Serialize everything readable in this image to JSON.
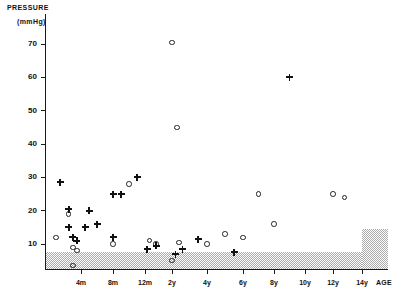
{
  "chart_data": {
    "type": "scatter",
    "title": "PRESSURE",
    "subtitle": "(mmHg)",
    "ylabel": "PRESSURE (mmHg)",
    "xlabel": "AGE",
    "ylim": [
      0,
      75
    ],
    "yticks": [
      10,
      20,
      30,
      40,
      50,
      60,
      70
    ],
    "ytick_labels": [
      "10",
      "20",
      "30",
      "40",
      "50",
      "60",
      "70"
    ],
    "xtick_labels": [
      "4m",
      "8m",
      "12m",
      "2y",
      "4y",
      "6y",
      "8y",
      "10y",
      "12y",
      "14y"
    ],
    "grid": false,
    "legend": null,
    "normal_band": {
      "label": "shaded normal range band",
      "low": 0,
      "high_main": 7.5,
      "high_right_step": 14.5,
      "step_start_age": "14y"
    },
    "series": [
      {
        "name": "open-circle",
        "marker": "circle",
        "points": [
          {
            "age": "1m",
            "value": 12.0
          },
          {
            "age": "2.5m",
            "value": 19.0
          },
          {
            "age": "3m",
            "value": 9.0
          },
          {
            "age": "3.5m",
            "value": 8.0
          },
          {
            "age": "3m",
            "value": 3.5
          },
          {
            "age": "8m",
            "value": 10.0
          },
          {
            "age": "10m",
            "value": 28.0
          },
          {
            "age": "14m",
            "value": 11.0
          },
          {
            "age": "17m",
            "value": 10.0
          },
          {
            "age": "2y",
            "value": 70.5
          },
          {
            "age": "2y",
            "value": 5.0
          },
          {
            "age": "2.3y",
            "value": 45.0
          },
          {
            "age": "2.4y",
            "value": 10.5
          },
          {
            "age": "4y",
            "value": 10.0
          },
          {
            "age": "5y",
            "value": 13.0
          },
          {
            "age": "6y",
            "value": 12.0
          },
          {
            "age": "7y",
            "value": 25.0
          },
          {
            "age": "8y",
            "value": 16.0
          },
          {
            "age": "12y",
            "value": 25.0
          },
          {
            "age": "12.8y",
            "value": 24.0
          }
        ]
      },
      {
        "name": "plus-cross",
        "marker": "plus",
        "points": [
          {
            "age": "1.5m",
            "value": 28.5
          },
          {
            "age": "2.5m",
            "value": 20.5
          },
          {
            "age": "2.5m",
            "value": 15.0
          },
          {
            "age": "3m",
            "value": 12.0
          },
          {
            "age": "3.5m",
            "value": 11.0
          },
          {
            "age": "4.5m",
            "value": 15.0
          },
          {
            "age": "5m",
            "value": 20.0
          },
          {
            "age": "6m",
            "value": 16.0
          },
          {
            "age": "8m",
            "value": 12.0
          },
          {
            "age": "8m",
            "value": 25.0
          },
          {
            "age": "9m",
            "value": 25.0
          },
          {
            "age": "11m",
            "value": 30.0
          },
          {
            "age": "13m",
            "value": 8.5
          },
          {
            "age": "17m",
            "value": 9.5
          },
          {
            "age": "2.2y",
            "value": 7.0
          },
          {
            "age": "2.6y",
            "value": 8.5
          },
          {
            "age": "3.5y",
            "value": 11.5
          },
          {
            "age": "5.5y",
            "value": 7.5
          },
          {
            "age": "9y",
            "value": 60.0
          }
        ]
      }
    ]
  }
}
